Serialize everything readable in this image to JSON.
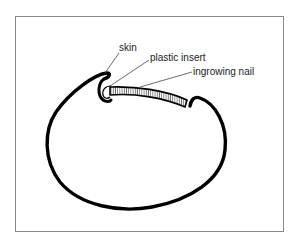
{
  "diagram": {
    "type": "cross-section illustration",
    "labels": [
      {
        "id": "skin",
        "text": "skin"
      },
      {
        "id": "plastic-insert",
        "text": "plastic insert"
      },
      {
        "id": "ingrowing-nail",
        "text": "ingrowing nail"
      }
    ]
  }
}
